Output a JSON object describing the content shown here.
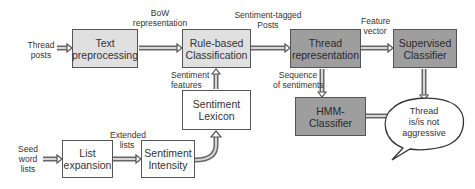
{
  "diagram": {
    "boxes": {
      "text_preprocessing": "Text preprocessing",
      "rule_based": "Rule-based Classification",
      "thread_representation": "Thread representation",
      "supervised_classifier": "Supervised Classifier",
      "sentiment_lexicon": "Sentiment Lexicon",
      "hmm_classifier": "HMM-Classifier",
      "list_expansion": "List expansion",
      "sentiment_intensity": "Sentiment Intensity"
    },
    "labels": {
      "thread_posts": [
        "Thread",
        "posts"
      ],
      "bow": [
        "BoW",
        "representation"
      ],
      "sentiment_tagged": [
        "Sentiment-tagged",
        "Posts"
      ],
      "feature_vector": [
        "Feature",
        "vector"
      ],
      "sentiment_features": [
        "Sentiment",
        "features"
      ],
      "sequence": [
        "Sequence",
        "of sentiments"
      ],
      "seed": [
        "Seed",
        "word",
        "lists"
      ],
      "extended": [
        "Extended",
        "lists"
      ]
    },
    "output_bubble": [
      "Thread",
      "is/is not",
      "aggressive"
    ],
    "colors": {
      "light_box": "#e0e0e0",
      "dark_box": "#9e9e9e",
      "white_box": "#ffffff",
      "border": "#555555"
    }
  }
}
